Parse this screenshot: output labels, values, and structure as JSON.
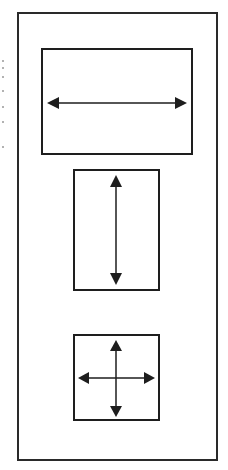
{
  "diagram": {
    "colors": {
      "stroke": "#1e1e1e",
      "background": "#ffffff"
    },
    "outer_frame": {
      "x": 17,
      "y": 12,
      "w": 201,
      "h": 449
    },
    "panels": [
      {
        "name": "horizontal",
        "arrow": "left-right double arrow",
        "x": 41,
        "y": 48,
        "w": 152,
        "h": 107
      },
      {
        "name": "vertical",
        "arrow": "up-down double arrow",
        "x": 73,
        "y": 169,
        "w": 87,
        "h": 122
      },
      {
        "name": "omnidirectional",
        "arrow": "four-way cross arrow",
        "x": 73,
        "y": 334,
        "w": 87,
        "h": 87
      }
    ]
  }
}
